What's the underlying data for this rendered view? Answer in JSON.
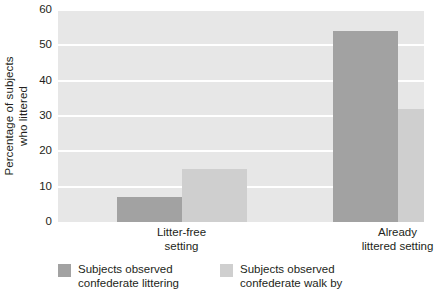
{
  "chart_data": {
    "type": "bar",
    "title": "",
    "subtitle": "",
    "xlabel": "",
    "ylabel": "Percentage of subjects\nwho littered",
    "categories": [
      "Litter-free\nsetting",
      "Already\nlittered setting"
    ],
    "series": [
      {
        "name": "Subjects observed\nconfederate littering",
        "color": "#a2a2a2",
        "values": [
          7,
          54
        ]
      },
      {
        "name": "Subjects observed\nconfederate walk by",
        "color": "#cfcfcf",
        "values": [
          15,
          32
        ]
      }
    ],
    "ylim": [
      0,
      60
    ],
    "yticks": [
      0,
      10,
      20,
      30,
      40,
      50,
      60
    ],
    "ytick_labels": [
      "0",
      "10",
      "20",
      "30",
      "40",
      "50",
      "60"
    ],
    "grid": true,
    "grid_color": "#ffffff",
    "plot_background": "#e7e7e7",
    "legend_position": "bottom"
  }
}
